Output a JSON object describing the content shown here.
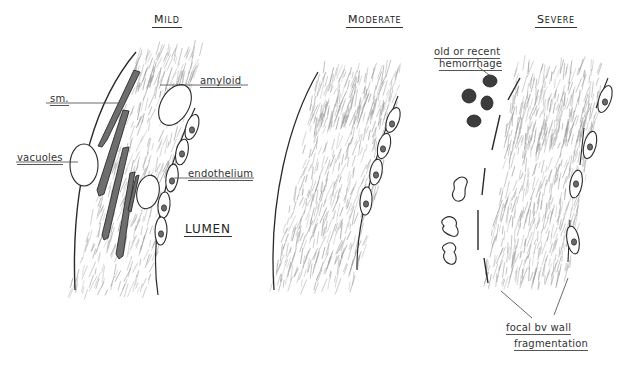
{
  "diagram": {
    "panels": [
      {
        "id": "mild",
        "title": "Mild"
      },
      {
        "id": "moderate",
        "title": "Moderate"
      },
      {
        "id": "severe",
        "title": "Severe"
      }
    ],
    "labels": {
      "amyloid": "amyloid",
      "sm": "sm.",
      "vacuoles": "vacuoles",
      "endothelium": "endothelium",
      "lumen": "LUMEN",
      "hemorrhage_line1": "old or recent",
      "hemorrhage_line2": "hemorrhage",
      "fragmentation_line1": "focal bv wall",
      "fragmentation_line2": "fragmentation"
    },
    "colors": {
      "ink": "#2a2a2a",
      "smooth_muscle_fill": "#6e6e6e",
      "hemorrhage_fill": "#3c3c3c",
      "hatch": "#9a9a9a"
    }
  }
}
